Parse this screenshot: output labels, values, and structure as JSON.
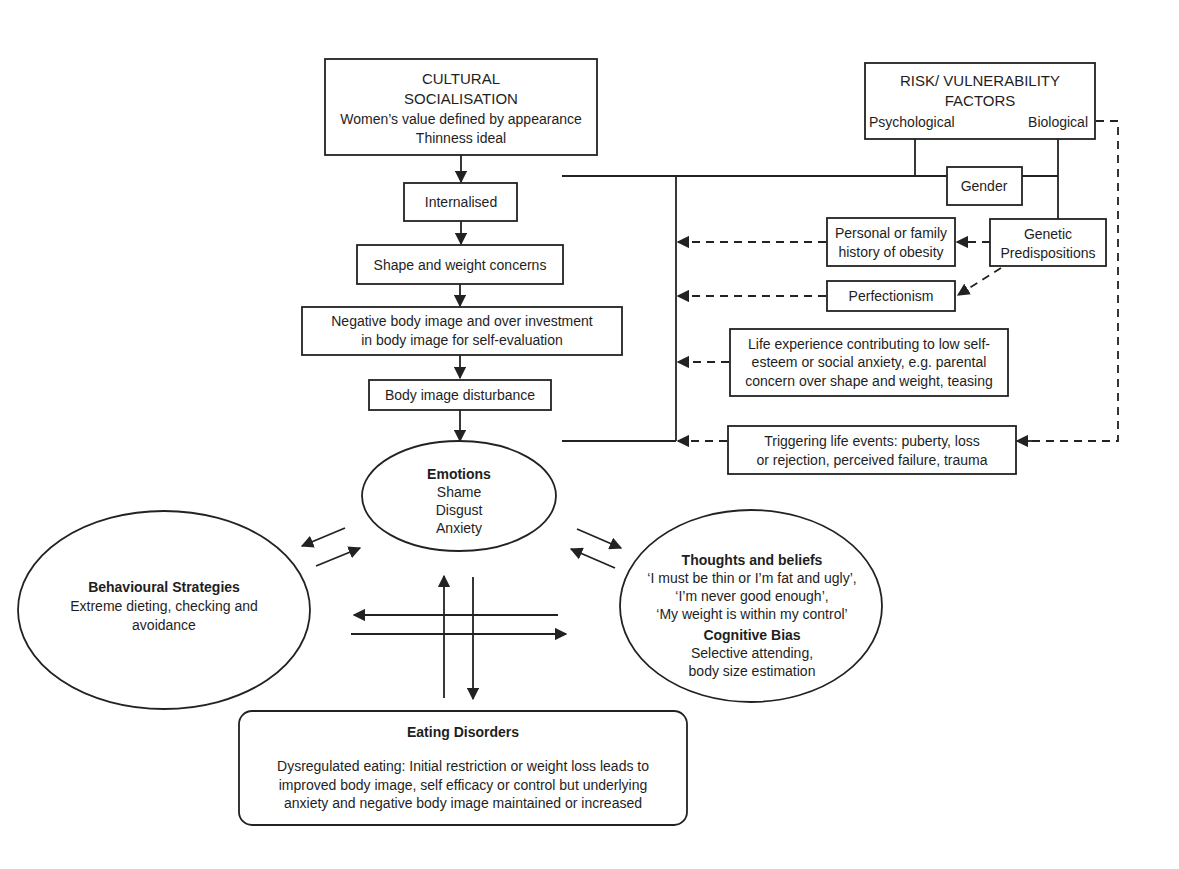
{
  "diagram": {
    "cultural": {
      "title_line1": "CULTURAL",
      "title_line2": "SOCIALISATION",
      "line3": "Women’s value defined by appearance",
      "line4": "Thinness ideal"
    },
    "chain": {
      "internalised": "Internalised",
      "shape_weight": "Shape and weight concerns",
      "negative_line1": "Negative body image and over investment",
      "negative_line2": "in body image for self-evaluation",
      "disturbance": "Body image disturbance"
    },
    "risk": {
      "title_line1": "RISK/ VULNERABILITY",
      "title_line2": "FACTORS",
      "psychological": "Psychological",
      "biological": "Biological",
      "gender": "Gender",
      "genetic_line1": "Genetic",
      "genetic_line2": "Predispositions",
      "obesity_line1": "Personal or family",
      "obesity_line2": "history of obesity",
      "perfectionism": "Perfectionism",
      "life_line1": "Life experience contributing to low self-",
      "life_line2": "esteem or social anxiety, e.g. parental",
      "life_line3": "concern over shape and weight, teasing",
      "trigger_line1": "Triggering life events: puberty, loss",
      "trigger_line2": "or rejection, perceived failure, trauma"
    },
    "emotions": {
      "title": "Emotions",
      "items": [
        "Shame",
        "Disgust",
        "Anxiety"
      ]
    },
    "behavioural": {
      "title": "Behavioural Strategies",
      "line1": "Extreme dieting, checking and",
      "line2": "avoidance"
    },
    "thoughts": {
      "title": "Thoughts and beliefs",
      "line1": "‘I must be thin or I’m fat and ugly’,",
      "line2": "‘I’m never good enough’,",
      "line3": "‘My weight is within my control’",
      "bias_title": "Cognitive Bias",
      "bias_line1": "Selective attending,",
      "bias_line2": "body size estimation"
    },
    "eating": {
      "title": "Eating Disorders",
      "line1": "Dysregulated eating: Initial restriction or weight loss leads to",
      "line2": "improved body image, self efficacy or control but underlying",
      "line3": "anxiety and negative body image maintained or increased"
    },
    "colors": {
      "stroke": "#222222",
      "text": "#1e1e1e",
      "background": "#ffffff"
    }
  }
}
